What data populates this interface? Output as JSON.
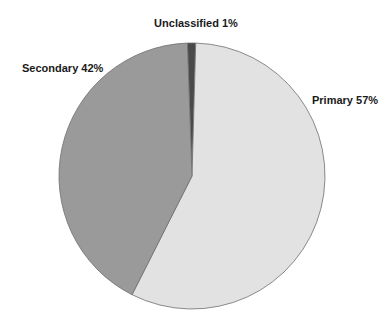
{
  "chart_data": {
    "type": "pie",
    "title": "",
    "categories": [
      "Unclassified",
      "Primary",
      "Secondary"
    ],
    "values": [
      1,
      57,
      42
    ],
    "labels": [
      "Unclassified 1%",
      "Primary 57%",
      "Secondary 42%"
    ],
    "colors": [
      "#4a4a4a",
      "#e2e2e2",
      "#9a9a9a"
    ],
    "legend": "none (data labels)",
    "start_angle_deg": -2,
    "direction": "clockwise"
  },
  "geometry": {
    "cx": 192,
    "cy": 176,
    "r": 133
  },
  "label_positions": [
    {
      "x": 196,
      "y": 27,
      "anchor": "middle"
    },
    {
      "x": 312,
      "y": 104,
      "anchor": "start"
    },
    {
      "x": 22,
      "y": 72,
      "anchor": "start"
    }
  ]
}
